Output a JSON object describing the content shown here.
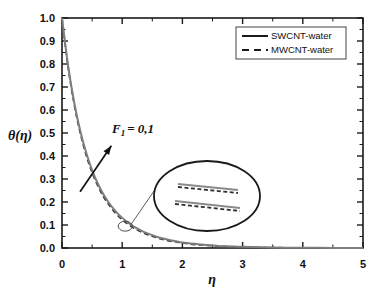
{
  "chart_data": {
    "type": "line",
    "title": "",
    "xlabel": "η",
    "ylabel": "θ(η)",
    "xlim": [
      0,
      5
    ],
    "ylim": [
      0,
      1.0
    ],
    "grid": false,
    "x_ticks": [
      "0",
      "1",
      "2",
      "3",
      "4",
      "5"
    ],
    "x_tick_values": [
      0,
      1,
      2,
      3,
      4,
      5
    ],
    "y_ticks": [
      "0.0",
      "0.1",
      "0.2",
      "0.3",
      "0.4",
      "0.5",
      "0.6",
      "0.7",
      "0.8",
      "0.9",
      "1.0"
    ],
    "y_tick_values": [
      0.0,
      0.1,
      0.2,
      0.3,
      0.4,
      0.5,
      0.6,
      0.7,
      0.8,
      0.9,
      1.0
    ],
    "x_minor_per_major": 2,
    "y_minor_per_major": 2,
    "legend_position": "top-right",
    "series": [
      {
        "name": "SWCNT-water",
        "style": "solid",
        "color": "#7e7e7e",
        "x": [
          0.0,
          0.1,
          0.2,
          0.3,
          0.4,
          0.5,
          0.6,
          0.7,
          0.8,
          0.9,
          1.0,
          1.1,
          1.2,
          1.3,
          1.4,
          1.5,
          1.6,
          1.7,
          1.8,
          1.9,
          2.0,
          2.2,
          2.4,
          2.6,
          2.8,
          3.0,
          3.5,
          4.0,
          4.5,
          5.0
        ],
        "y": [
          1.0,
          0.795,
          0.637,
          0.513,
          0.416,
          0.339,
          0.277,
          0.228,
          0.189,
          0.157,
          0.131,
          0.11,
          0.092,
          0.078,
          0.066,
          0.056,
          0.047,
          0.04,
          0.034,
          0.029,
          0.024,
          0.018,
          0.013,
          0.009,
          0.007,
          0.005,
          0.002,
          0.001,
          0.0005,
          0.0
        ]
      },
      {
        "name": "MWCNT-water",
        "style": "dashed",
        "color": "#3a3a3a",
        "x": [
          0.0,
          0.1,
          0.2,
          0.3,
          0.4,
          0.5,
          0.6,
          0.7,
          0.8,
          0.9,
          1.0,
          1.1,
          1.2,
          1.3,
          1.4,
          1.5,
          1.6,
          1.7,
          1.8,
          1.9,
          2.0,
          2.2,
          2.4,
          2.6,
          2.8,
          3.0,
          3.5,
          4.0,
          4.5,
          5.0
        ],
        "y": [
          1.0,
          0.789,
          0.628,
          0.503,
          0.405,
          0.328,
          0.267,
          0.218,
          0.18,
          0.148,
          0.123,
          0.103,
          0.086,
          0.072,
          0.06,
          0.051,
          0.043,
          0.036,
          0.03,
          0.026,
          0.022,
          0.015,
          0.011,
          0.008,
          0.006,
          0.004,
          0.0015,
          0.0008,
          0.0003,
          0.0
        ]
      }
    ],
    "annotations": [
      {
        "name": "parameter-label",
        "text_main": "F",
        "text_sub": "1",
        "text_rest": "= 0,1",
        "full_text": "F₁ = 0,1",
        "x": 0.95,
        "y": 0.5,
        "arrow_from": [
          0.3,
          0.245
        ],
        "arrow_to": [
          0.82,
          0.445
        ]
      }
    ],
    "inset": {
      "name": "magnifier-inset",
      "shape": "ellipse",
      "source_point": [
        1.05,
        0.095
      ],
      "pairs": 2,
      "lines_per_pair": 2,
      "line_styles": [
        "solid",
        "dashed"
      ],
      "description": "magnified view of curve separation"
    }
  },
  "legend": {
    "entries": [
      {
        "label": "SWCNT-water",
        "style": "solid"
      },
      {
        "label": "MWCNT-water",
        "style": "dashed"
      }
    ]
  },
  "colors": {
    "swcnt": "#7e7e7e",
    "mwcnt": "#3a3a3a",
    "axis": "#1a1a1a",
    "background": "#ffffff"
  }
}
